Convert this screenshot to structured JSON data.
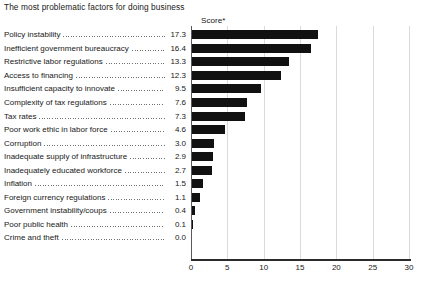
{
  "chart_data": {
    "type": "bar",
    "orientation": "horizontal",
    "title": "The most problematic factors for doing business",
    "value_header": "Score*",
    "xlabel": "",
    "ylabel": "",
    "xlim": [
      0,
      30
    ],
    "xticks": [
      0,
      5,
      10,
      15,
      20,
      25,
      30
    ],
    "xtick_labels": [
      "0",
      "5",
      "10",
      "15",
      "20",
      "25",
      "30"
    ],
    "grid": true,
    "legend": null,
    "categories": [
      "Policy instability",
      "Inefficient government bureaucracy",
      "Restrictive labor regulations",
      "Access to financing",
      "Insufficient capacity to innovate",
      "Complexity of tax regulations",
      "Tax rates",
      "Poor work ethic in labor force",
      "Corruption",
      "Inadequate supply of infrastructure",
      "Inadequately educated workforce",
      "Inflation",
      "Foreign currency regulations",
      "Government instability/coups",
      "Poor public health",
      "Crime and theft"
    ],
    "values": [
      17.3,
      16.4,
      13.3,
      12.3,
      9.5,
      7.6,
      7.3,
      4.6,
      3.0,
      2.9,
      2.7,
      1.5,
      1.1,
      0.4,
      0.1,
      0.0
    ],
    "value_labels": [
      "17.3",
      "16.4",
      "13.3",
      "12.3",
      "9.5",
      "7.6",
      "7.3",
      "4.6",
      "3.0",
      "2.9",
      "2.7",
      "1.5",
      "1.1",
      "0.4",
      "0.1",
      "0.0"
    ],
    "colors": {
      "bar": "#111111",
      "gridline": "#d9dadb",
      "axis": "#2b2b2b",
      "text": "#202020",
      "background": "#ffffff"
    }
  }
}
